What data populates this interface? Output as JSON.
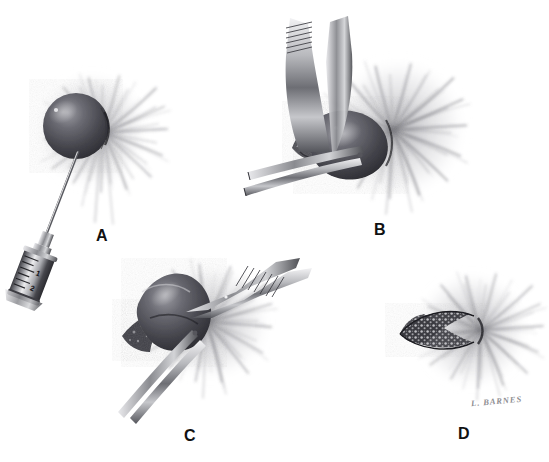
{
  "figure": {
    "medium": "graphite pencil medical illustration",
    "background_color": "#ffffff",
    "ink_color": "#2b2b2e",
    "signature": "L. BARNES",
    "panel_count": 4
  },
  "panels": [
    {
      "id": "A",
      "label": "A",
      "label_x": 96,
      "label_y": 228,
      "caption": "Needle and syringe aspiration of the cyst",
      "instruments": [
        "syringe",
        "hypodermic needle"
      ],
      "cyst_center_x": 78,
      "cyst_center_y": 125
    },
    {
      "id": "B",
      "label": "B",
      "label_x": 374,
      "label_y": 222,
      "caption": "Toothed forceps elevate the cyst while scissors dissect the base",
      "instruments": [
        "tissue forceps",
        "dissecting scissors"
      ],
      "cyst_center_x": 356,
      "cyst_center_y": 135
    },
    {
      "id": "C",
      "label": "C",
      "label_x": 184,
      "label_y": 428,
      "caption": "Continued sharp dissection and delivery of the cyst wall",
      "instruments": [
        "tissue forceps",
        "dissecting scissors"
      ],
      "cyst_center_x": 180,
      "cyst_center_y": 315
    },
    {
      "id": "D",
      "label": "D",
      "label_x": 458,
      "label_y": 428,
      "caption": "Closed elliptical wound after cyst removal",
      "instruments": [],
      "cyst_center_x": 470,
      "cyst_center_y": 330
    }
  ],
  "syringe": {
    "barrel_graduations": [
      "1",
      "2"
    ],
    "graduation_1": "1",
    "graduation_2": "2",
    "needle_tip_x": 78,
    "needle_tip_y": 150,
    "hub_x": 40,
    "hub_y": 250
  },
  "colors": {
    "paper": "#ffffff",
    "graphite_dark": "#2b2b2e",
    "graphite_mid": "#6e6e74",
    "graphite_light": "#b9b9be",
    "halo": "#9a9aa0",
    "metal_light": "#e6e6e9",
    "metal_mid": "#9fa0a5",
    "metal_dark": "#4a4a4f",
    "signature": "#8d8d91"
  }
}
